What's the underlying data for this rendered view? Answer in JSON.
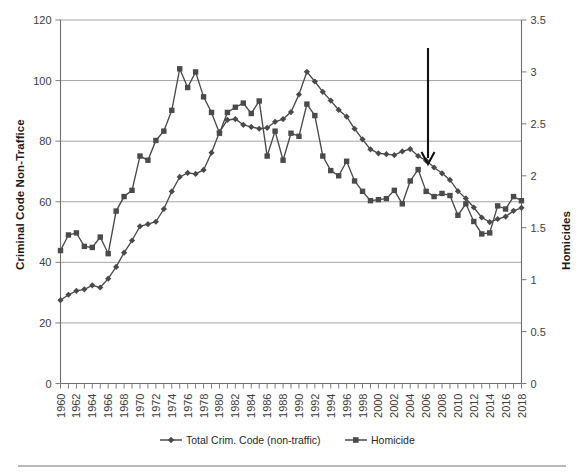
{
  "chart_data": {
    "type": "line",
    "title": "",
    "xlabel": "",
    "ylabel": "Criminal Code Non-Traffice",
    "y2label": "Homicides",
    "grid": true,
    "legend_position": "bottom",
    "xlim": [
      1960,
      2018
    ],
    "ylim": [
      0,
      120
    ],
    "y2lim": [
      0,
      3.5
    ],
    "yticks": [
      0,
      20,
      40,
      60,
      80,
      100,
      120
    ],
    "y2ticks": [
      0,
      0.5,
      1,
      1.5,
      2,
      2.5,
      3,
      3.5
    ],
    "xticks": [
      1960,
      1962,
      1964,
      1966,
      1968,
      1970,
      1972,
      1974,
      1976,
      1978,
      1980,
      1982,
      1984,
      1986,
      1988,
      1990,
      1992,
      1994,
      1996,
      1998,
      2000,
      2002,
      2004,
      2006,
      2008,
      2010,
      2012,
      2014,
      2016,
      2018
    ],
    "x": [
      1960,
      1961,
      1962,
      1963,
      1964,
      1965,
      1966,
      1967,
      1968,
      1969,
      1970,
      1971,
      1972,
      1973,
      1974,
      1975,
      1976,
      1977,
      1978,
      1979,
      1980,
      1981,
      1982,
      1983,
      1984,
      1985,
      1986,
      1987,
      1988,
      1989,
      1990,
      1991,
      1992,
      1993,
      1994,
      1995,
      1996,
      1997,
      1998,
      1999,
      2000,
      2001,
      2002,
      2003,
      2004,
      2005,
      2006,
      2007,
      2008,
      2009,
      2010,
      2011,
      2012,
      2013,
      2014,
      2015,
      2016,
      2017,
      2018
    ],
    "series": [
      {
        "name": "Total Crim. Code  (non-traffic)",
        "axis": "left",
        "marker": "diamond",
        "color": "#4a4a4a",
        "values": [
          27.5,
          29.3,
          30.6,
          31.1,
          32.4,
          31.7,
          34.6,
          38.5,
          43.2,
          47.2,
          51.9,
          52.6,
          53.4,
          57.6,
          63.4,
          68.2,
          69.5,
          69.2,
          70.5,
          76.2,
          83.0,
          87.0,
          87.3,
          85.4,
          84.7,
          84.1,
          84.4,
          86.4,
          87.3,
          89.6,
          95.4,
          102.9,
          99.7,
          96.3,
          93.4,
          90.3,
          88.1,
          84.1,
          80.6,
          77.3,
          76.0,
          75.7,
          75.4,
          76.6,
          77.4,
          75.1,
          73.6,
          71.3,
          69.4,
          67.2,
          63.5,
          61.1,
          58.1,
          54.8,
          53.3,
          54.3,
          55.1,
          57.0,
          58.0
        ],
        "notes": "Criminal Code non-traffic incidents, rate per 1,000 population; peaks at 1991 (102.9), declines to ~53 in 2013-2014 then rises slightly"
      },
      {
        "name": "Homicide",
        "axis": "right",
        "marker": "square",
        "color": "#4a4a4a",
        "values": [
          1.28,
          1.43,
          1.45,
          1.32,
          1.31,
          1.41,
          1.25,
          1.66,
          1.8,
          1.86,
          2.19,
          2.15,
          2.34,
          2.43,
          2.63,
          3.03,
          2.85,
          3.0,
          2.76,
          2.61,
          2.41,
          2.61,
          2.66,
          2.7,
          2.6,
          2.72,
          2.19,
          2.43,
          2.15,
          2.41,
          2.38,
          2.69,
          2.58,
          2.19,
          2.05,
          2.0,
          2.14,
          1.95,
          1.85,
          1.76,
          1.77,
          1.78,
          1.86,
          1.73,
          1.95,
          2.06,
          1.85,
          1.8,
          1.83,
          1.81,
          1.62,
          1.73,
          1.56,
          1.44,
          1.45,
          1.71,
          1.68,
          1.8,
          1.76
        ],
        "notes": "Homicide rate per 100,000 population; peaks 1975 (3.03) and 1991 (2.69), low around 2013-2014 (~1.44)"
      }
    ],
    "annotations": [
      {
        "type": "arrow",
        "x": 2005,
        "y_top": 3.2,
        "y_bottom": 2.25,
        "direction": "down",
        "label": ""
      }
    ]
  },
  "legend": {
    "entries": [
      {
        "label": "Total Crim. Code  (non-traffic)",
        "marker": "diamond"
      },
      {
        "label": "Homicide",
        "marker": "square"
      }
    ]
  },
  "axes": {
    "left_title": "Criminal Code Non-Traffice",
    "right_title": "Homicides"
  }
}
